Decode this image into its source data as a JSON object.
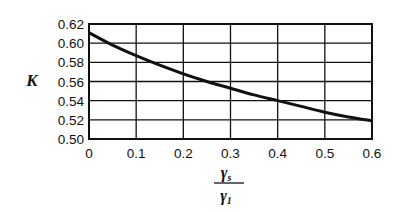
{
  "chart_data": {
    "type": "line",
    "title": "",
    "xlabel": "γs / γ1",
    "xlabel_numerator": "γ",
    "xlabel_numerator_sub": "s",
    "xlabel_denominator": "γ",
    "xlabel_denominator_sub": "1",
    "ylabel": "K",
    "xlim": [
      0,
      0.6
    ],
    "ylim": [
      0.5,
      0.62
    ],
    "grid": true,
    "legend": null,
    "x_ticks": [
      "0",
      "0.1",
      "0.2",
      "0.3",
      "0.4",
      "0.5",
      "0.6"
    ],
    "y_ticks": [
      "0.50",
      "0.52",
      "0.54",
      "0.56",
      "0.58",
      "0.60",
      "0.62"
    ],
    "series": [
      {
        "name": "K",
        "x": [
          0,
          0.05,
          0.1,
          0.15,
          0.2,
          0.25,
          0.3,
          0.35,
          0.4,
          0.45,
          0.5,
          0.55,
          0.6
        ],
        "values": [
          0.611,
          0.598,
          0.587,
          0.577,
          0.568,
          0.56,
          0.553,
          0.546,
          0.54,
          0.534,
          0.528,
          0.523,
          0.519
        ]
      }
    ]
  }
}
